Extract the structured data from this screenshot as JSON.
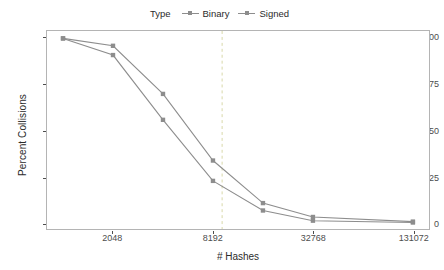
{
  "legend": {
    "title": "Type",
    "position": "top",
    "items": [
      {
        "label": "Binary",
        "color": "#8d8d8d",
        "key_icon": "line-point-key-icon"
      },
      {
        "label": "Signed",
        "color": "#8d8d8d",
        "key_icon": "line-point-key-icon"
      }
    ]
  },
  "axes": {
    "x_title": "# Hashes",
    "y_title": "Percent Collisions"
  },
  "chart_data": {
    "type": "line",
    "title": "",
    "subtitle": "",
    "xlabel": "# Hashes",
    "ylabel": "Percent Collisions",
    "x_scale": "log2",
    "x": [
      1024,
      2048,
      4096,
      8192,
      16384,
      32768,
      131072
    ],
    "x_tick_values": [
      2048,
      8192,
      32768,
      131072
    ],
    "x_tick_labels": [
      "2048",
      "8192",
      "32768",
      "131072"
    ],
    "xlim": [
      820,
      163840
    ],
    "y_tick_values": [
      0,
      25,
      50,
      75,
      100
    ],
    "y_tick_labels": [
      "0",
      "25",
      "50",
      "75",
      "100"
    ],
    "ylim": [
      -3,
      104
    ],
    "grid": false,
    "legend_position": "top",
    "series": [
      {
        "name": "Binary",
        "color": "#8d8d8d",
        "marker": "square",
        "values": [
          100,
          91,
          56,
          23,
          7,
          1.5,
          0.5
        ]
      },
      {
        "name": "Signed",
        "color": "#8d8d8d",
        "marker": "square",
        "values": [
          100,
          96,
          70,
          34,
          11,
          3.5,
          1
        ]
      }
    ],
    "annotations": [
      {
        "type": "vline",
        "name": "reference-line",
        "x": 9300,
        "style": "dashed",
        "color": "#d9d9a8"
      }
    ]
  }
}
